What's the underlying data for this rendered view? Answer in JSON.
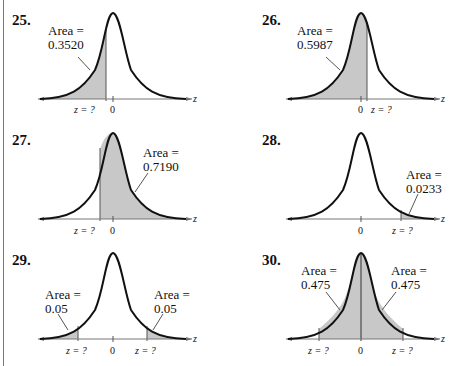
{
  "exercises": [
    {
      "number": "25.",
      "area_label": "Area =",
      "area_value": "0.3520",
      "z_label": "z = ?",
      "zero": "0",
      "axis": "z"
    },
    {
      "number": "26.",
      "area_label": "Area =",
      "area_value": "0.5987",
      "z_label": "z = ?",
      "zero": "0",
      "axis": "z"
    },
    {
      "number": "27.",
      "area_label": "Area =",
      "area_value": "0.7190",
      "z_label": "z = ?",
      "zero": "0",
      "axis": "z"
    },
    {
      "number": "28.",
      "area_label": "Area =",
      "area_value": "0.0233",
      "z_label": "z = ?",
      "zero": "0",
      "axis": "z"
    },
    {
      "number": "29.",
      "left_area_label": "Area =",
      "left_area_value": "0.05",
      "right_area_label": "Area =",
      "right_area_value": "0.05",
      "z_left": "z = ?",
      "z_right": "z = ?",
      "zero": "0",
      "axis": "z"
    },
    {
      "number": "30.",
      "left_area_label": "Area =",
      "left_area_value": "0.475",
      "right_area_label": "Area =",
      "right_area_value": "0.475",
      "z_left": "z = ?",
      "z_right": "z = ?",
      "zero": "0",
      "axis": "z"
    }
  ],
  "colors": {
    "shade": "#c8c8c8",
    "curve": "#111111",
    "axis": "#777777"
  }
}
